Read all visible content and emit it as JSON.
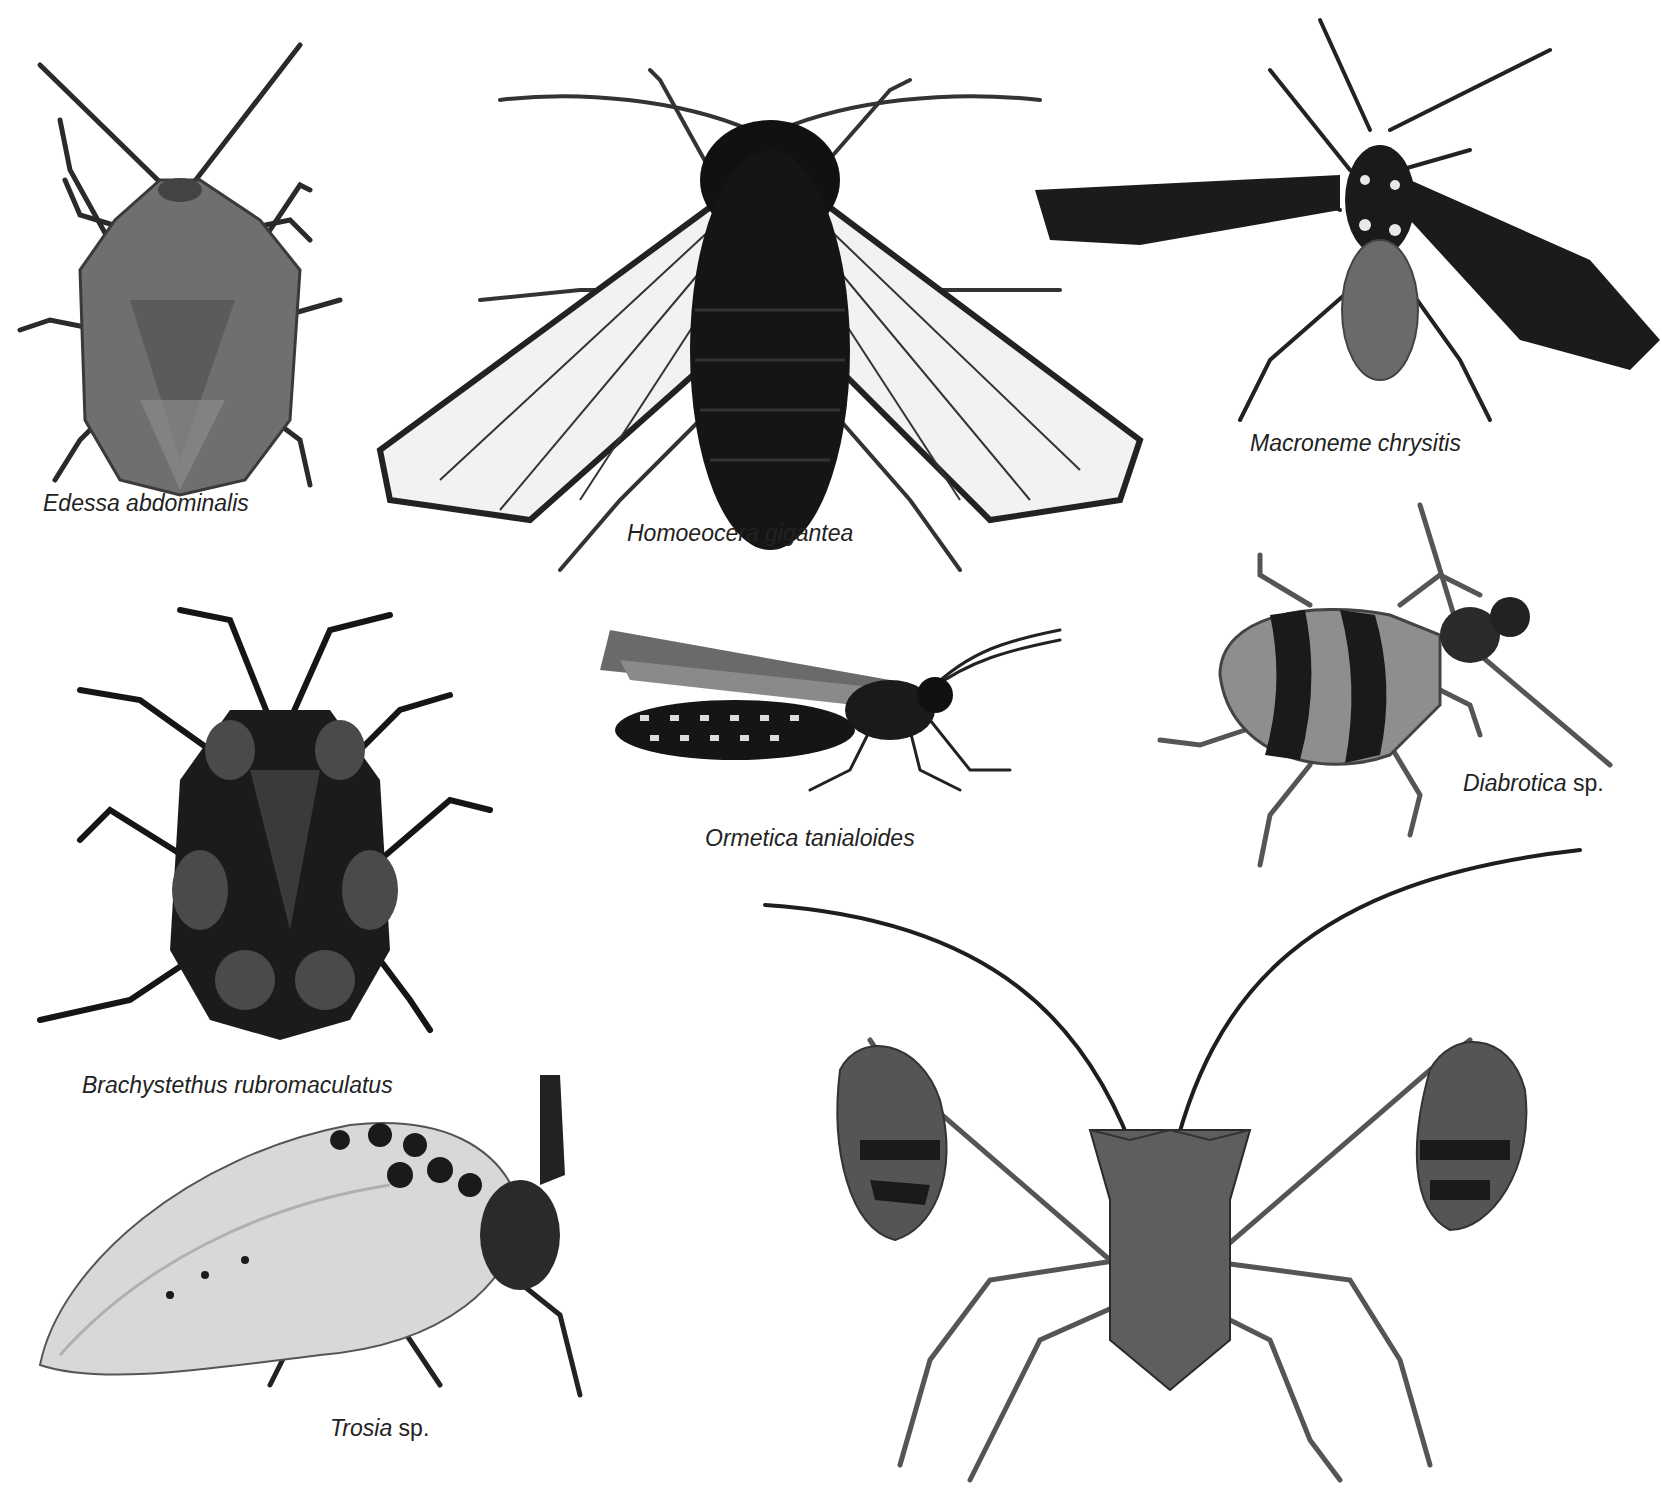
{
  "plate": {
    "background": "#ffffff",
    "tone": "grayscale"
  },
  "specimens": [
    {
      "id": "edessa",
      "genus_species": "Edessa abdominalis",
      "suffix": "",
      "kind": "stink bug (dorsal view)"
    },
    {
      "id": "homoeocera",
      "genus_species": "Homoeocera gigantea",
      "suffix": "",
      "kind": "clear-winged moth (dorsal view)"
    },
    {
      "id": "macroneme",
      "genus_species": "Macroneme chrysitis",
      "suffix": "",
      "kind": "wasp-mimic moth (dorsal view)"
    },
    {
      "id": "brachystethus",
      "genus_species": "Brachystethus rubromaculatus",
      "suffix": "",
      "kind": "spotted shield bug (dorsal view)"
    },
    {
      "id": "ormetica",
      "genus_species": "Ormetica tanialoides",
      "suffix": "",
      "kind": "tiger moth (lateral view)"
    },
    {
      "id": "diabrotica",
      "genus_species": "Diabrotica",
      "suffix": " sp.",
      "kind": "banded leaf beetle"
    },
    {
      "id": "trosia",
      "genus_species": "Trosia",
      "suffix": " sp.",
      "kind": "spotted furry moth (lateral view)"
    },
    {
      "id": "leaf-footed-bug",
      "genus_species": "",
      "suffix": "",
      "kind": "leaf-footed bug (frontal view)"
    }
  ]
}
